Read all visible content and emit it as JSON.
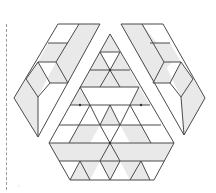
{
  "figure": {
    "pieces": [
      "left-strip",
      "right-strip",
      "center-region"
    ],
    "colors": {
      "stroke": "#4a4a4a",
      "shade": "#e9e9e9",
      "background": "#ffffff",
      "dash": "#9a9a9a"
    },
    "margin_mark": "·"
  }
}
